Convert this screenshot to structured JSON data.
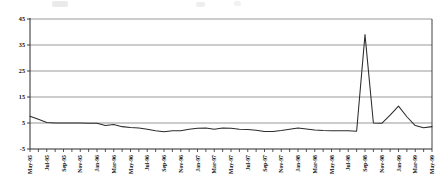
{
  "chart_data": {
    "type": "line",
    "title": "",
    "subtitle": "",
    "xlabel": "",
    "ylabel": "",
    "grid": true,
    "legend": false,
    "legend_position": "none",
    "ylim": [
      -5,
      45
    ],
    "yticks": [
      -5,
      5,
      15,
      25,
      35,
      45
    ],
    "ytick_labels": [
      "-5",
      "5",
      "15",
      "25",
      "35",
      "45"
    ],
    "xlim": [
      "May-95",
      "May-99"
    ],
    "xtick_labels": [
      "May-95",
      "Jul-95",
      "Sep-95",
      "Nov-95",
      "Jan-96",
      "Mar-96",
      "May-96",
      "Jul-96",
      "Sep-96",
      "Nov-96",
      "Jan-97",
      "Mar-97",
      "May-97",
      "Jul-97",
      "Sep-97",
      "Nov-97",
      "Jan-98",
      "Mar-98",
      "May-98",
      "Jul-98",
      "Sep-98",
      "Nov-98",
      "Jan-99",
      "Mar-99",
      "May-99"
    ],
    "x": [
      "May-95",
      "Jun-95",
      "Jul-95",
      "Aug-95",
      "Sep-95",
      "Oct-95",
      "Nov-95",
      "Dec-95",
      "Jan-96",
      "Feb-96",
      "Mar-96",
      "Apr-96",
      "May-96",
      "Jun-96",
      "Jul-96",
      "Aug-96",
      "Sep-96",
      "Oct-96",
      "Nov-96",
      "Dec-96",
      "Jan-97",
      "Feb-97",
      "Mar-97",
      "Apr-97",
      "May-97",
      "Jun-97",
      "Jul-97",
      "Aug-97",
      "Sep-97",
      "Oct-97",
      "Nov-97",
      "Dec-97",
      "Jan-98",
      "Feb-98",
      "Mar-98",
      "Apr-98",
      "May-98",
      "Jun-98",
      "Jul-98",
      "Aug-98",
      "Sep-98",
      "Oct-98",
      "Nov-98",
      "Dec-98",
      "Jan-99",
      "Feb-99",
      "Mar-99",
      "Apr-99",
      "May-99"
    ],
    "series": [
      {
        "name": "Rate",
        "color": "#2b2b2b",
        "values": [
          7.6,
          6.4,
          5.2,
          5.0,
          5.0,
          5.0,
          5.0,
          4.9,
          4.9,
          4.0,
          4.4,
          3.6,
          3.3,
          3.1,
          2.6,
          2.0,
          1.6,
          2.0,
          2.0,
          2.6,
          3.0,
          3.1,
          2.6,
          3.1,
          3.0,
          2.6,
          2.5,
          2.2,
          1.7,
          1.7,
          2.1,
          2.6,
          3.1,
          2.7,
          2.3,
          2.1,
          2.0,
          2.0,
          2.0,
          1.8,
          39.0,
          5.0,
          4.9,
          8.0,
          11.5,
          7.4,
          4.0,
          3.2,
          3.6
        ]
      }
    ],
    "annotations": []
  },
  "axes": {
    "plot_left": 30,
    "plot_right": 432,
    "plot_top": 19,
    "plot_bottom": 149
  }
}
